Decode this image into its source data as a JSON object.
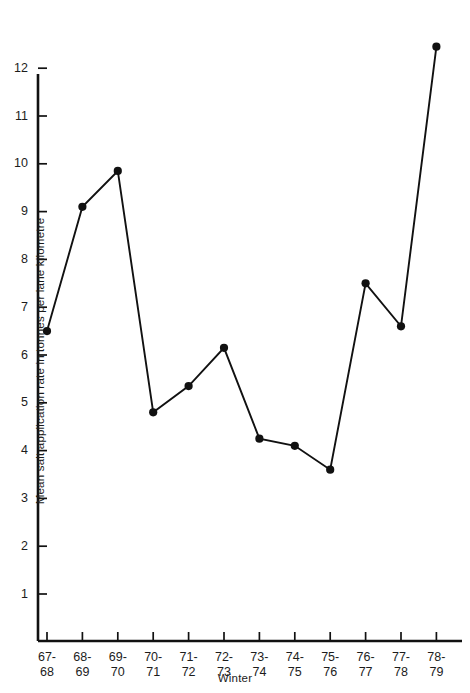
{
  "chart_data": {
    "type": "line",
    "title": "",
    "xlabel": "Winter",
    "ylabel": "Mean salt application rate in tonnes per lane kilometre",
    "categories": [
      "67-68",
      "68-69",
      "69-70",
      "70-71",
      "71-72",
      "72-73",
      "73-74",
      "74-75",
      "75-76",
      "76-77",
      "77-78",
      "78-79"
    ],
    "tick_lines": [
      [
        "67-",
        "68"
      ],
      [
        "68-",
        "69"
      ],
      [
        "69-",
        "70"
      ],
      [
        "70-",
        "71"
      ],
      [
        "71-",
        "72"
      ],
      [
        "72-",
        "73"
      ],
      [
        "73-",
        "74"
      ],
      [
        "74-",
        "75"
      ],
      [
        "75-",
        "76"
      ],
      [
        "76-",
        "77"
      ],
      [
        "77-",
        "78"
      ],
      [
        "78-",
        "79"
      ]
    ],
    "values": [
      6.5,
      9.1,
      9.85,
      4.8,
      5.35,
      6.15,
      4.25,
      4.1,
      3.6,
      7.5,
      6.6,
      12.45
    ],
    "yticks": [
      1,
      2,
      3,
      4,
      5,
      6,
      7,
      8,
      9,
      10,
      11,
      12
    ],
    "ytick_labels": [
      "1",
      "2",
      "3",
      "4",
      "5",
      "6",
      "7",
      "8",
      "9",
      "10",
      "11",
      "12"
    ],
    "ylim": [
      0,
      12.9
    ],
    "grid": false,
    "legend": null,
    "marker": "filled-circle",
    "line_color": "#111111",
    "marker_color": "#111111",
    "axis_color": "#111111",
    "background": "#ffffff"
  }
}
